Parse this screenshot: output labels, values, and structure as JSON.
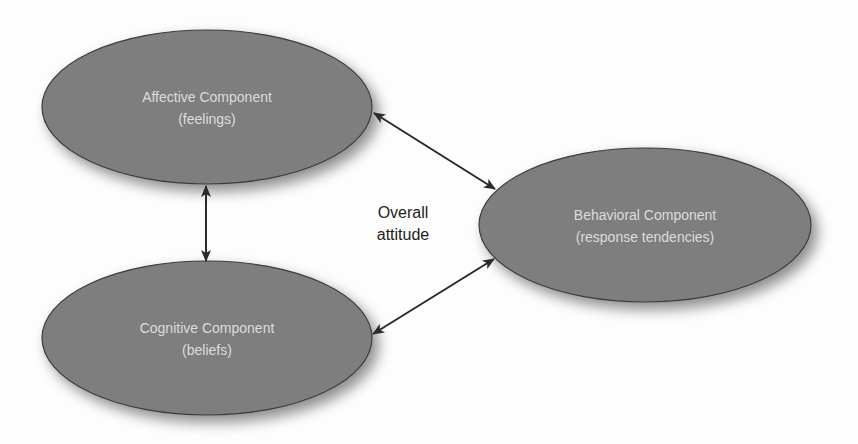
{
  "diagram": {
    "title": "",
    "colors": {
      "node_fill": "#7e7e7e",
      "node_stroke": "#3c3c3c",
      "node_text": "#dcdcdc",
      "arrow": "#2a2a2a",
      "label_text": "#1e1e1e",
      "background": "#fdfdfd"
    },
    "nodes": [
      {
        "id": "affective",
        "title": "Affective Component",
        "subtitle": "(feelings)",
        "shape": "ellipse",
        "cx": 207,
        "cy": 107,
        "rx": 165,
        "ry": 77
      },
      {
        "id": "cognitive",
        "title": "Cognitive Component",
        "subtitle": "(beliefs)",
        "shape": "ellipse",
        "cx": 207,
        "cy": 338,
        "rx": 165,
        "ry": 77
      },
      {
        "id": "behavioral",
        "title": "Behavioral Component",
        "subtitle": "(response tendencies)",
        "shape": "ellipse",
        "cx": 645,
        "cy": 225,
        "rx": 166,
        "ry": 77
      }
    ],
    "center_label": {
      "line1": "Overall",
      "line2": "attitude"
    },
    "edges": [
      {
        "from": "affective",
        "to": "cognitive",
        "direction": "bidirectional"
      },
      {
        "from": "affective",
        "to": "behavioral",
        "direction": "bidirectional"
      },
      {
        "from": "cognitive",
        "to": "behavioral",
        "direction": "bidirectional"
      }
    ]
  }
}
